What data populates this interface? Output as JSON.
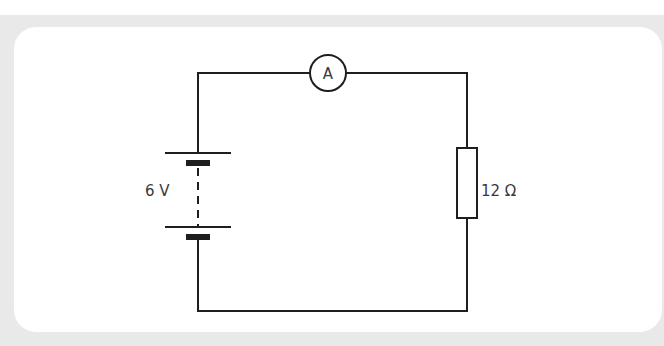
{
  "diagram": {
    "type": "circuit",
    "background_color": "#e9e9e9",
    "panel_color": "#ffffff",
    "wire_color": "#1e1e1e",
    "components": {
      "battery": {
        "label": "6 V",
        "voltage_value": 6,
        "unit": "V"
      },
      "ammeter": {
        "label": "A"
      },
      "resistor": {
        "label": "12 Ω",
        "resistance_value": 12,
        "unit": "Ω"
      }
    }
  }
}
